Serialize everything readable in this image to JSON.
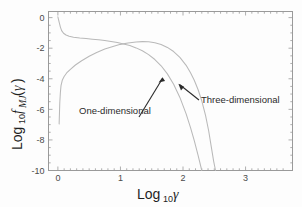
{
  "figure": {
    "background_color": "#fdfdfd",
    "frame_color": "#9a9a9a",
    "curve_color": "#b9b9b9",
    "text_color": "#2b2b2b"
  },
  "axes": {
    "x_title_main": "Log",
    "x_title_sub": "10",
    "x_title_var": "γ",
    "y_title_main": "Log",
    "y_title_sub": "10",
    "y_title_fn": "f",
    "y_title_fn_sub": "MJ",
    "y_title_open": "(",
    "y_title_var": "γ",
    "y_title_close": ")",
    "x_ticks": [
      "0",
      "1",
      "2",
      "3"
    ],
    "y_ticks": [
      "0",
      "-2",
      "-4",
      "-6",
      "-8",
      "-10"
    ]
  },
  "annotations": [
    {
      "name": "one-dimensional",
      "label": "One-dimensional"
    },
    {
      "name": "three-dimensional",
      "label": "Three-dimensional"
    }
  ],
  "chart_data": {
    "type": "line",
    "title": "",
    "xlabel": "Log10 gamma",
    "ylabel": "Log10 f_MJ(gamma)",
    "xlim": [
      -0.15,
      3.75
    ],
    "ylim": [
      -10,
      0.4
    ],
    "grid": false,
    "legend": "annotations-with-arrows",
    "x_ticks": [
      0,
      1,
      2,
      3
    ],
    "y_ticks": [
      0,
      -2,
      -4,
      -6,
      -8,
      -10
    ],
    "series": [
      {
        "name": "One-dimensional",
        "color": "#b9b9b9",
        "points": [
          [
            0.0,
            0.05
          ],
          [
            0.02,
            -0.3
          ],
          [
            0.04,
            -0.62
          ],
          [
            0.06,
            -0.85
          ],
          [
            0.09,
            -1.02
          ],
          [
            0.13,
            -1.14
          ],
          [
            0.18,
            -1.22
          ],
          [
            0.25,
            -1.28
          ],
          [
            0.35,
            -1.33
          ],
          [
            0.45,
            -1.37
          ],
          [
            0.55,
            -1.41
          ],
          [
            0.65,
            -1.45
          ],
          [
            0.75,
            -1.5
          ],
          [
            0.85,
            -1.56
          ],
          [
            0.95,
            -1.63
          ],
          [
            1.05,
            -1.72
          ],
          [
            1.15,
            -1.83
          ],
          [
            1.25,
            -1.98
          ],
          [
            1.35,
            -2.17
          ],
          [
            1.45,
            -2.42
          ],
          [
            1.55,
            -2.74
          ],
          [
            1.65,
            -3.15
          ],
          [
            1.75,
            -3.68
          ],
          [
            1.85,
            -4.36
          ],
          [
            1.95,
            -5.22
          ],
          [
            2.05,
            -6.3
          ],
          [
            2.12,
            -7.2
          ],
          [
            2.18,
            -8.05
          ],
          [
            2.24,
            -9.0
          ],
          [
            2.3,
            -10.0
          ]
        ]
      },
      {
        "name": "Three-dimensional",
        "color": "#b9b9b9",
        "points": [
          [
            0.02,
            -6.95
          ],
          [
            0.03,
            -5.6
          ],
          [
            0.04,
            -4.9
          ],
          [
            0.05,
            -4.45
          ],
          [
            0.07,
            -4.1
          ],
          [
            0.1,
            -3.85
          ],
          [
            0.14,
            -3.62
          ],
          [
            0.2,
            -3.38
          ],
          [
            0.28,
            -3.1
          ],
          [
            0.38,
            -2.82
          ],
          [
            0.5,
            -2.53
          ],
          [
            0.62,
            -2.28
          ],
          [
            0.75,
            -2.06
          ],
          [
            0.88,
            -1.89
          ],
          [
            1.0,
            -1.75
          ],
          [
            1.12,
            -1.66
          ],
          [
            1.25,
            -1.59
          ],
          [
            1.35,
            -1.57
          ],
          [
            1.45,
            -1.58
          ],
          [
            1.55,
            -1.64
          ],
          [
            1.65,
            -1.76
          ],
          [
            1.75,
            -1.95
          ],
          [
            1.85,
            -2.22
          ],
          [
            1.95,
            -2.6
          ],
          [
            2.05,
            -3.12
          ],
          [
            2.12,
            -3.6
          ],
          [
            2.18,
            -4.1
          ],
          [
            2.24,
            -4.7
          ],
          [
            2.3,
            -5.45
          ],
          [
            2.36,
            -6.4
          ],
          [
            2.41,
            -7.4
          ],
          [
            2.45,
            -8.4
          ],
          [
            2.49,
            -9.4
          ],
          [
            2.52,
            -10.0
          ]
        ]
      }
    ]
  }
}
